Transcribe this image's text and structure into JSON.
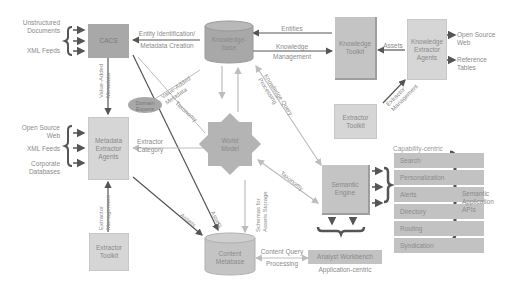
{
  "nodes": {
    "cacs": "CACS",
    "knowledge_base": [
      "Knowledge-",
      "base"
    ],
    "knowledge_toolkit": [
      "Knowledge",
      "Toolkit"
    ],
    "knowledge_extractor_agents": [
      "Knowledge",
      "Extractor",
      "Agents"
    ],
    "metadata_extractor_agents": [
      "Metadata",
      "Extractor",
      "Agents"
    ],
    "world_model": [
      "World",
      "Model"
    ],
    "domain_experts": [
      "Domain",
      "Experts"
    ],
    "extractor_toolkit_top": [
      "Extractor",
      "Toolkit"
    ],
    "extractor_toolkit_bottom": [
      "Extractor",
      "Toolkit"
    ],
    "semantic_engine": [
      "Semantic",
      "Engine"
    ],
    "content_metabase": [
      "Content",
      "Metabase"
    ],
    "analyst_workbench": "Analyst Workbench"
  },
  "inputs": {
    "cacs": [
      "Unstructured",
      "Documents",
      "XML Feeds"
    ],
    "metadata_extractor": [
      "Open Source",
      "Web",
      "XML Feeds",
      "Corporate",
      "Databases"
    ],
    "knowledge_extractor": [
      "Open Source",
      "Web",
      "Reference",
      "Tables"
    ]
  },
  "edges": {
    "entity_identification": "Entity Identification/",
    "metadata_creation": "Metadata Creation",
    "entities": "Entities",
    "knowledge": "Knowledge",
    "management": "Management",
    "assets_top": "Assets",
    "value_added_metadata_v": [
      "Value-Added",
      "Metadata"
    ],
    "value_added_metadata_d": [
      "Value-Added",
      "Metadata"
    ],
    "taxonomy_1": "Taxonomy",
    "taxonomy_2": "Taxonomy",
    "knowledge_query_processing": [
      "Knowledge Query",
      "Processing"
    ],
    "extractor_management_top": [
      "Extractor",
      "Management"
    ],
    "extractor_category": [
      "Extractor",
      "Category"
    ],
    "extractor_management_bottom": [
      "Extractor",
      "Management"
    ],
    "assets_1": "Assets",
    "assets_2": "Assets",
    "schemas_for_assets_storage": [
      "Schemas for",
      "Assets Storage"
    ],
    "content_query_processing": [
      "Content Query",
      "Processing"
    ]
  },
  "capability_centric": {
    "heading": "Capability-centric",
    "items": [
      "Search",
      "Personalization",
      "Alerts",
      "Directory",
      "Routing",
      "Syndication"
    ]
  },
  "semantic_apis": [
    "Semantic",
    "Application",
    "APIs"
  ],
  "application_centric": "Application-centric",
  "colors": {
    "dark_box": "#a8a8a8",
    "mid_box": "#c4c4c4",
    "light_box": "#d6d6d6",
    "arrow_dark": "#555555",
    "arrow_light": "#bdbdbd",
    "text": "#8a8a8a"
  }
}
